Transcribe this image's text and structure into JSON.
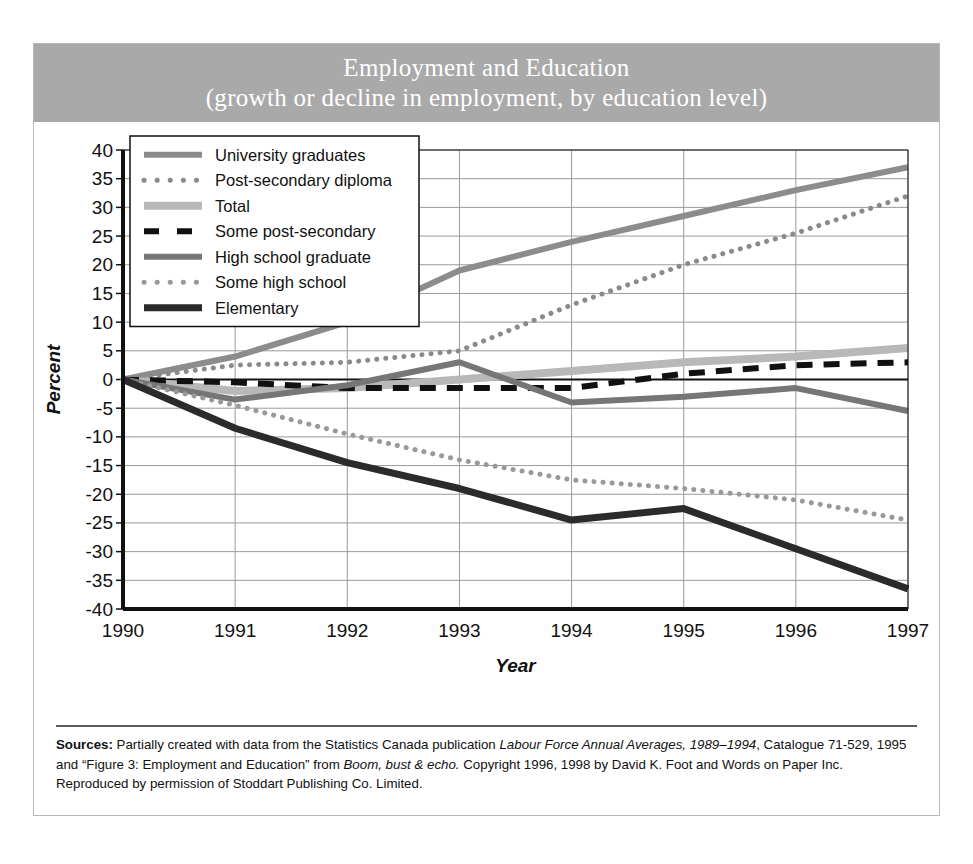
{
  "title": {
    "line1": "Employment and Education",
    "line2": "(growth or decline in employment, by education level)"
  },
  "banner_color": "#a9a9a9",
  "source": {
    "label": "Sources:",
    "seg1": " Partially created with data from the Statistics Canada publication ",
    "italic1": "Labour Force Annual Averages, 1989–1994",
    "seg2": ", Catalogue 71-529, 1995  and “Figure 3: Employment and Education” from ",
    "italic2": "Boom, bust & echo.",
    "seg3": " Copyright 1996, 1998 by David K. Foot and Words on Paper Inc. Reproduced by permission of Stoddart Publishing Co. Limited."
  },
  "chart_data": {
    "type": "line",
    "title": "Employment and Education (growth or decline in employment, by education level)",
    "xlabel": "Year",
    "ylabel": "Percent",
    "x": [
      1990,
      1991,
      1992,
      1993,
      1994,
      1995,
      1996,
      1997
    ],
    "xtick_labels": [
      "1990",
      "1991",
      "1992",
      "1993",
      "1994",
      "1995",
      "1996",
      "1997"
    ],
    "xlim": [
      1990,
      1997
    ],
    "ylim": [
      -40,
      40
    ],
    "ytick_labels": [
      "40",
      "35",
      "30",
      "25",
      "20",
      "15",
      "10",
      "5",
      "0",
      "-5",
      "-10",
      "-15",
      "-20",
      "-25",
      "-30",
      "-35",
      "-40"
    ],
    "ytick_values": [
      40,
      35,
      30,
      25,
      20,
      15,
      10,
      5,
      0,
      -5,
      -10,
      -15,
      -20,
      -25,
      -30,
      -35,
      -40
    ],
    "grid": true,
    "legend_position": "upper-left",
    "series": [
      {
        "name": "University graduates",
        "color": "#8c8c8c",
        "style": "solid",
        "width": 6,
        "values": [
          0,
          4,
          10,
          19,
          24,
          28.5,
          33,
          37
        ]
      },
      {
        "name": "Post-secondary diploma",
        "color": "#8a8a8a",
        "style": "dotted",
        "width": 5,
        "values": [
          0,
          2.5,
          3,
          5,
          13,
          20,
          25.5,
          32
        ]
      },
      {
        "name": "Total",
        "color": "#b8b8b8",
        "style": "solid",
        "width": 8,
        "values": [
          0,
          -2,
          -1.5,
          0,
          1.5,
          3,
          4,
          5.5
        ]
      },
      {
        "name": "Some post-secondary",
        "color": "#111111",
        "style": "dashed",
        "width": 6,
        "values": [
          0,
          -0.5,
          -1.5,
          -1.5,
          -1.5,
          1,
          2.5,
          3
        ]
      },
      {
        "name": "High school graduate",
        "color": "#767676",
        "style": "solid",
        "width": 6,
        "values": [
          0,
          -3.5,
          -1,
          3,
          -4,
          -3,
          -1.5,
          -5.5
        ]
      },
      {
        "name": "Some high school",
        "color": "#999999",
        "style": "dotted",
        "width": 5,
        "values": [
          0,
          -4.5,
          -9.5,
          -14,
          -17.5,
          -19,
          -21,
          -24.5
        ]
      },
      {
        "name": "Elementary",
        "color": "#2b2b2b",
        "style": "solid",
        "width": 7,
        "values": [
          0,
          -8.5,
          -14.5,
          -19,
          -24.5,
          -22.5,
          -29.5,
          -36.5
        ]
      }
    ]
  }
}
